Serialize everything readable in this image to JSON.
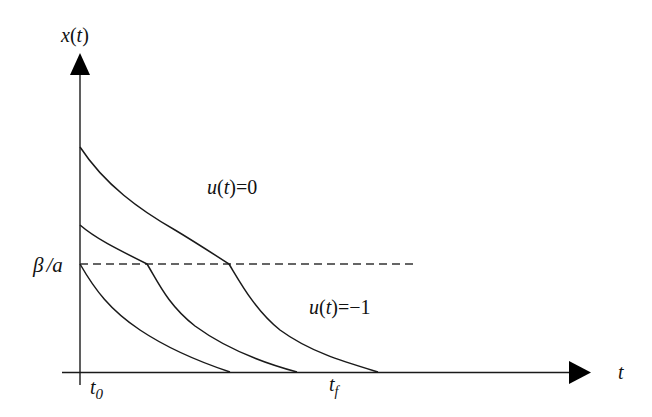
{
  "diagram": {
    "type": "state-trajectory-phase-plot",
    "y_axis_label": {
      "var": "x",
      "arg": "t"
    },
    "x_axis_label": "t",
    "threshold_label": {
      "beta": "β",
      "slash": "/",
      "a": "a"
    },
    "t0_label": {
      "base": "t",
      "sub": "0"
    },
    "tf_label": {
      "base": "t",
      "sub": "f"
    },
    "region_upper_label": {
      "fn": "u",
      "arg": "t",
      "eq": "=0"
    },
    "region_lower_label": {
      "fn": "u",
      "arg": "t",
      "eq": "=−1"
    },
    "colors": {
      "stroke": "#1a1a1a",
      "dashed": "#333333",
      "background": "#ffffff"
    },
    "curves": [
      {
        "name": "top-trajectory",
        "start": [
          80,
          147
        ],
        "switch": [
          229,
          264
        ],
        "end": [
          378,
          372
        ]
      },
      {
        "name": "middle-trajectory",
        "start": [
          80,
          225
        ],
        "switch": [
          147,
          264
        ],
        "end": [
          297,
          372
        ]
      },
      {
        "name": "bottom-trajectory",
        "start": [
          80,
          264
        ],
        "end": [
          230,
          372
        ]
      }
    ]
  }
}
